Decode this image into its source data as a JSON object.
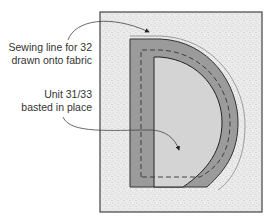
{
  "diagram": {
    "annotations": [
      {
        "id": "sewing-line",
        "lines": [
          "Sewing line for 32",
          "drawn onto fabric"
        ]
      },
      {
        "id": "unit-basted",
        "lines": [
          "Unit 31/33",
          "basted in place"
        ]
      }
    ],
    "colors": {
      "background_fabric": "#e6e6e6",
      "fabric_speckle": "#9a9a9a",
      "unit_dark": "#9b9b9b",
      "unit_light": "#d4d4d4",
      "outline": "#333333",
      "frame": "#444444",
      "sewing_line": "#888888"
    }
  }
}
